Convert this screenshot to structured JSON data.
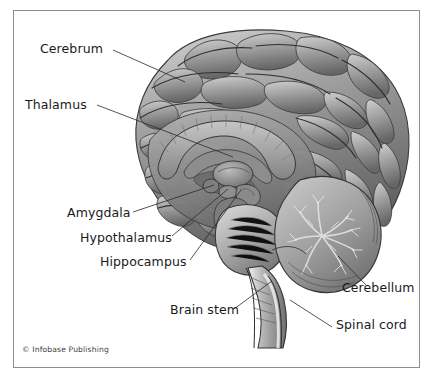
{
  "figure": {
    "style": "grayscale medical illustration",
    "credit": "© Infobase Publishing",
    "frame_color": "#8d8d8d",
    "background_color": "#ffffff",
    "label_color": "#1a1a1a",
    "leader_color": "#2a2a2a"
  },
  "labels": [
    {
      "id": "cerebrum",
      "text": "Cerebrum",
      "x": 40,
      "y": 43
    },
    {
      "id": "thalamus",
      "text": "Thalamus",
      "x": 25,
      "y": 99
    },
    {
      "id": "amygdala",
      "text": "Amygdala",
      "x": 67,
      "y": 214
    },
    {
      "id": "hypothalamus",
      "text": "Hypothalamus",
      "x": 80,
      "y": 239
    },
    {
      "id": "hippocampus",
      "text": "Hippocampus",
      "x": 100,
      "y": 263
    },
    {
      "id": "brain-stem",
      "text": "Brain stem",
      "x": 170,
      "y": 311
    },
    {
      "id": "cerebellum",
      "text": "Cerebellum",
      "x": 342,
      "y": 289
    },
    {
      "id": "spinal-cord",
      "text": "Spinal cord",
      "x": 336,
      "y": 326
    }
  ],
  "leaders": [
    {
      "id": "cerebrum-leader",
      "from": [
        113,
        50
      ],
      "to": [
        185,
        82
      ]
    },
    {
      "id": "thalamus-leader",
      "from": [
        97,
        105
      ],
      "to": [
        233,
        157
      ]
    },
    {
      "id": "amygdala-leader",
      "from": [
        133,
        212
      ],
      "to": [
        214,
        185
      ]
    },
    {
      "id": "hypothalamus-leader",
      "from": [
        172,
        236
      ],
      "to": [
        228,
        189
      ]
    },
    {
      "id": "hippocampus-leader",
      "from": [
        190,
        260
      ],
      "to": [
        241,
        190
      ]
    },
    {
      "id": "brain-stem-leader",
      "from": [
        234,
        309
      ],
      "to": [
        272,
        281
      ]
    },
    {
      "id": "cerebellum-leader",
      "from": [
        366,
        285
      ],
      "to": [
        338,
        256
      ]
    },
    {
      "id": "spinal-cord-leader",
      "from": [
        332,
        327
      ],
      "to": [
        290,
        300
      ]
    }
  ],
  "structures": [
    {
      "id": "cerebrum",
      "name": "cerebrum"
    },
    {
      "id": "corpus-callosum",
      "name": "corpus callosum"
    },
    {
      "id": "thalamus",
      "name": "thalamus"
    },
    {
      "id": "amygdala",
      "name": "amygdala"
    },
    {
      "id": "hypothalamus",
      "name": "hypothalamus"
    },
    {
      "id": "hippocampus",
      "name": "hippocampus"
    },
    {
      "id": "cerebellum",
      "name": "cerebellum"
    },
    {
      "id": "pons",
      "name": "pons"
    },
    {
      "id": "medulla",
      "name": "medulla oblongata"
    },
    {
      "id": "brain-stem",
      "name": "brain stem"
    },
    {
      "id": "spinal-cord",
      "name": "spinal cord"
    }
  ]
}
